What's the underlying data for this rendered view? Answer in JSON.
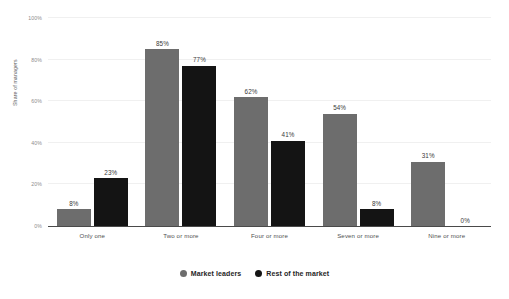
{
  "chart_data": {
    "type": "bar",
    "title": "",
    "subtitle": "",
    "xlabel": "",
    "ylabel": "Share of managers",
    "ylim": [
      0,
      100
    ],
    "y_ticks": [
      "0%",
      "20%",
      "40%",
      "60%",
      "80%",
      "100%"
    ],
    "y_tick_values": [
      0,
      20,
      40,
      60,
      80,
      100
    ],
    "grid": true,
    "legend_position": "bottom-center",
    "categories": [
      "Only one",
      "Two or more",
      "Four or more",
      "Seven or more",
      "Nine or more"
    ],
    "series": [
      {
        "name": "Market leaders",
        "color": "#6d6d6d",
        "values": [
          8,
          85,
          62,
          54,
          31
        ],
        "labels": [
          "8%",
          "85%",
          "62%",
          "54%",
          "31%"
        ]
      },
      {
        "name": "Rest of the market",
        "color": "#141414",
        "values": [
          23,
          77,
          41,
          8,
          0
        ],
        "labels": [
          "23%",
          "77%",
          "41%",
          "8%",
          "0%"
        ]
      }
    ]
  },
  "legend": {
    "items": [
      {
        "label": "Market leaders",
        "marker": "circle-marker-gray",
        "color": "#6d6d6d"
      },
      {
        "label": "Rest of the market",
        "marker": "circle-marker-black",
        "color": "#141414"
      }
    ]
  },
  "axis": {
    "y_title": "Share of managers"
  }
}
